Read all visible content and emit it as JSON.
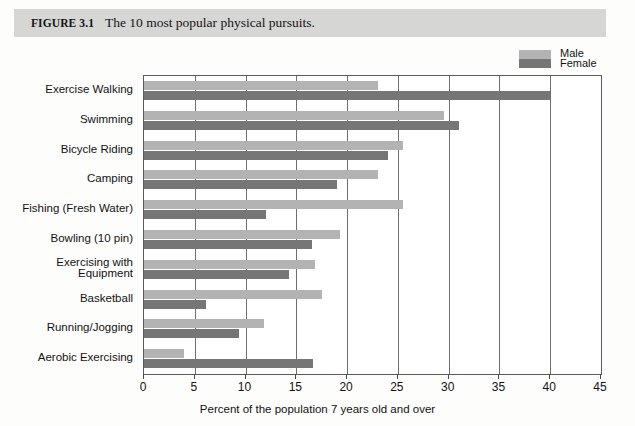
{
  "header": {
    "figure_label": "FIGURE 3.1",
    "caption": "The 10 most popular physical pursuits.",
    "band_color": "#d6d6d4"
  },
  "legend": {
    "position": "top-right",
    "entries": [
      {
        "label": "Male",
        "color": "#b3b3b3"
      },
      {
        "label": "Female",
        "color": "#767676"
      }
    ]
  },
  "axis": {
    "x_ticks": [
      "0",
      "5",
      "10",
      "15",
      "20",
      "25",
      "30",
      "35",
      "40",
      "45"
    ],
    "x_title": "Percent of the population 7 years old and over"
  },
  "chart_data": {
    "type": "bar",
    "orientation": "horizontal",
    "title": "The 10 most popular physical pursuits.",
    "xlabel": "Percent of the population 7 years old and over",
    "ylabel": "",
    "xlim": [
      0,
      45
    ],
    "xticks": [
      0,
      5,
      10,
      15,
      20,
      25,
      30,
      35,
      40,
      45
    ],
    "grid": "vertical",
    "legend_position": "top-right",
    "categories": [
      "Exercise Walking",
      "Swimming",
      "Bicycle Riding",
      "Camping",
      "Fishing (Fresh Water)",
      "Bowling (10 pin)",
      "Exercising with\nEquipment",
      "Basketball",
      "Running/Jogging",
      "Aerobic Exercising"
    ],
    "series": [
      {
        "name": "Male",
        "color": "#b3b3b3",
        "values": [
          23.0,
          29.5,
          25.5,
          23.0,
          25.5,
          19.3,
          16.8,
          17.5,
          11.8,
          3.9
        ]
      },
      {
        "name": "Female",
        "color": "#767676",
        "values": [
          40.0,
          31.0,
          24.0,
          19.0,
          12.0,
          16.5,
          14.3,
          6.1,
          9.4,
          16.6
        ]
      }
    ]
  }
}
